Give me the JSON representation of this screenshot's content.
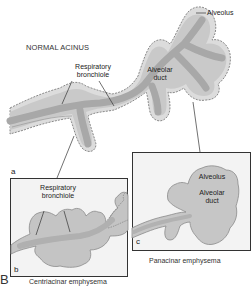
{
  "figure": {
    "panel_letter": "B",
    "normal": {
      "title": "NORMAL ACINUS",
      "panel": "a",
      "labels": {
        "alveolus": "Alveolus",
        "respiratory_bronchiole_1": "Respiratory",
        "respiratory_bronchiole_2": "bronchiole",
        "alveolar_duct_1": "Alveolar",
        "alveolar_duct_2": "duct"
      }
    },
    "centriacinar": {
      "panel": "b",
      "caption": "Centriacinar emphysema",
      "labels": {
        "respiratory_bronchiole_1": "Respiratory",
        "respiratory_bronchiole_2": "bronchiole"
      }
    },
    "panacinar": {
      "panel": "c",
      "caption": "Panacinar emphysema",
      "labels": {
        "alveolus": "Alveolus",
        "alveolar_duct_1": "Alveolar",
        "alveolar_duct_2": "duct"
      }
    },
    "colors": {
      "tissue_fill": "#c8c8c8",
      "tissue_core": "#a9a9a9",
      "outline": "#8a8a8a",
      "box_bg": "#f3f3f3"
    }
  }
}
